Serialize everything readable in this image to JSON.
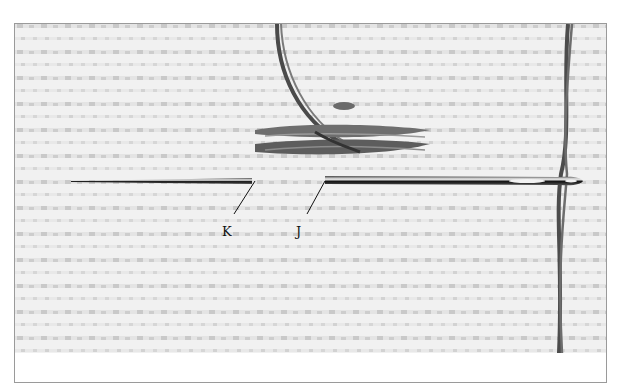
{
  "figure": {
    "labels": [
      {
        "id": "K",
        "text": "K"
      },
      {
        "id": "J",
        "text": "J"
      }
    ],
    "colors": {
      "fabric": "#f2f2f2",
      "fabric_holes": "#c8c8c8",
      "thread": "#555555",
      "needle": "#1a1a1a",
      "frame": "#9a9a9a"
    }
  }
}
